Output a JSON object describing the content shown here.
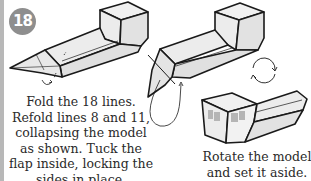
{
  "step": {
    "number": "18",
    "badge_color": "#8e8e8e"
  },
  "instructions": {
    "left": "Fold the 18 lines. Refold lines 8 and 11, collapsing the model as shown. Tuck the flap inside, locking the sides in place.",
    "right": "Rotate the model and set it aside."
  },
  "figures": [
    {
      "name": "model-before-fold",
      "description": "Flat box model with pointed end, fold marks"
    },
    {
      "name": "model-collapsing",
      "description": "Model with flap being tucked, arrow indicating tuck"
    },
    {
      "name": "rotate-symbol",
      "description": "Circular rotation arrows"
    },
    {
      "name": "model-rotated",
      "description": "Finished model rotated, set aside"
    }
  ],
  "colors": {
    "line": "#1a1a1a",
    "face_fill": "#e6e6e6",
    "face_light": "#f2f2f2",
    "shade": "#b0b0b0",
    "text": "#2a2a2a"
  }
}
